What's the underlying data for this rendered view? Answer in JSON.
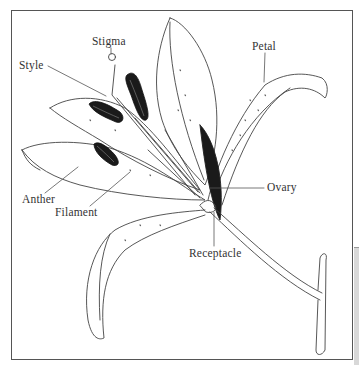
{
  "diagram": {
    "labels": [
      {
        "id": "stigma",
        "text": "Stigma"
      },
      {
        "id": "style",
        "text": "Style"
      },
      {
        "id": "petal",
        "text": "Petal"
      },
      {
        "id": "anther",
        "text": "Anther"
      },
      {
        "id": "filament",
        "text": "Filament"
      },
      {
        "id": "ovary",
        "text": "Ovary"
      },
      {
        "id": "receptacle",
        "text": "Receptacle"
      }
    ]
  },
  "colors": {
    "line": "#444444",
    "anther_fill": "#1a1a1a",
    "frame": "#555555",
    "side_panel": "#d8d8d8"
  }
}
